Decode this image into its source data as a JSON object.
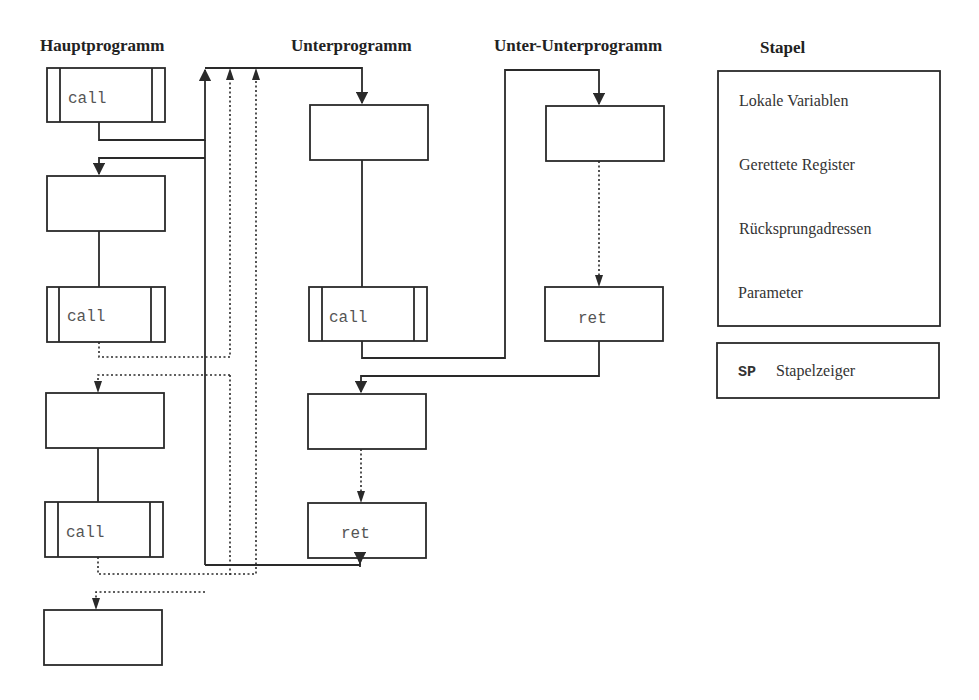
{
  "columns": {
    "main": "Hauptprogramm",
    "sub": "Unterprogramm",
    "subsub": "Unter-Unterprogramm",
    "stack": "Stapel"
  },
  "main_program": {
    "blocks": [
      {
        "type": "call",
        "label": "call"
      },
      {
        "type": "plain",
        "label": ""
      },
      {
        "type": "call",
        "label": "call"
      },
      {
        "type": "plain",
        "label": ""
      },
      {
        "type": "call",
        "label": "call"
      },
      {
        "type": "plain",
        "label": ""
      }
    ]
  },
  "sub_program": {
    "blocks": [
      {
        "type": "plain",
        "label": ""
      },
      {
        "type": "call",
        "label": "call"
      },
      {
        "type": "plain",
        "label": ""
      },
      {
        "type": "ret",
        "label": "ret"
      }
    ]
  },
  "subsub_program": {
    "blocks": [
      {
        "type": "plain",
        "label": ""
      },
      {
        "type": "ret",
        "label": "ret"
      }
    ]
  },
  "stack": {
    "items": [
      "Lokale Variablen",
      "Gerettete Register",
      "Rücksprungadressen",
      "Parameter"
    ],
    "pointer_abbr": "SP",
    "pointer_label": "Stapelzeiger"
  },
  "colors": {
    "line": "#2a2a2a",
    "background": "#ffffff"
  }
}
